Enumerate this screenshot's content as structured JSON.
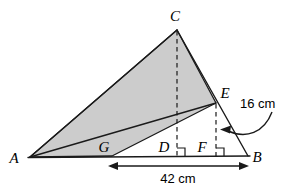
{
  "figure": {
    "colors": {
      "shade_fill": "#cccccc",
      "stroke": "#1a1a1a",
      "background": "#ffffff"
    },
    "vertices": [
      {
        "id": "A",
        "label": "A",
        "x": 30,
        "y": 157,
        "label_x": 14,
        "label_y": 162
      },
      {
        "id": "B",
        "label": "B",
        "x": 248,
        "y": 156,
        "label_x": 254,
        "label_y": 161
      },
      {
        "id": "C",
        "label": "C",
        "x": 177,
        "y": 30,
        "label_x": 169,
        "label_y": 21
      },
      {
        "id": "E",
        "label": "E",
        "x": 216,
        "y": 103,
        "label_x": 221,
        "label_y": 97
      },
      {
        "id": "G",
        "label": "G",
        "x": 112,
        "y": 156,
        "label_x": 101,
        "label_y": 152
      },
      {
        "id": "D",
        "label": "D",
        "x": 177,
        "y": 156,
        "label_x": 159,
        "label_y": 152
      },
      {
        "id": "F",
        "label": "F",
        "x": 216,
        "y": 156,
        "label_x": 197,
        "label_y": 152
      }
    ],
    "shaded_region": {
      "name": "quadrilateral-ACEG",
      "points": "30,157 177,30 216,103 112,156"
    },
    "solid_edges": [
      {
        "name": "side-AC",
        "from": "A",
        "to": "C"
      },
      {
        "name": "side-CB",
        "from": "C",
        "to": "B"
      },
      {
        "name": "side-AB",
        "from": "A",
        "to": "B"
      },
      {
        "name": "segment-GE",
        "from": "G",
        "to": "E"
      }
    ],
    "dashed_edges": [
      {
        "name": "altitude-CD",
        "from": "C",
        "to": "D"
      },
      {
        "name": "altitude-EF",
        "from": "E",
        "to": "F"
      }
    ],
    "right_angles": [
      {
        "name": "right-angle-at-D",
        "x": 177,
        "y": 156
      },
      {
        "name": "right-angle-at-F",
        "x": 216,
        "y": 156
      }
    ],
    "measurements": [
      {
        "id": "ef-length",
        "text": "16 cm",
        "text_x": 240,
        "text_y": 107,
        "annotation": "curved-arrow-to-EF",
        "arrow_path": "M 272 112 C 262 132, 244 138, 226 131",
        "arrow_tip_x": 222,
        "arrow_tip_y": 130
      },
      {
        "id": "gb-length",
        "text": "42 cm",
        "text_x": 178,
        "text_y": 182,
        "annotation": "double-headed-arrow-G-to-B",
        "arrow_y": 166,
        "arrow_x1": 110,
        "arrow_x2": 247
      }
    ]
  }
}
